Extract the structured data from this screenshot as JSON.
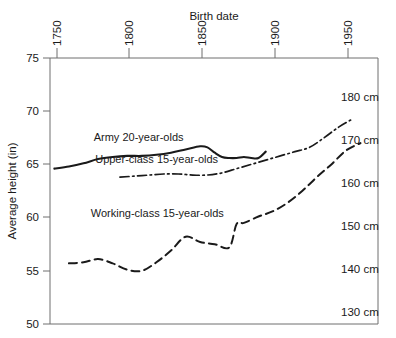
{
  "chart_data": {
    "type": "line",
    "title": "",
    "xlabel": "Birth date",
    "ylabel": "Average height (in)",
    "xlim": [
      1737,
      1962
    ],
    "ylim": [
      50,
      75
    ],
    "grid": false,
    "legend_position": "inline-annotations",
    "x_ticks": [
      "1750",
      "1800",
      "1850",
      "1900",
      "1950"
    ],
    "x_tick_values": [
      1750,
      1800,
      1850,
      1900,
      1950
    ],
    "y_ticks": [
      "75",
      "70",
      "65",
      "60",
      "55",
      "50"
    ],
    "y_tick_values": [
      75,
      70,
      65,
      60,
      55,
      50
    ],
    "secondary_axis": {
      "label": "cm",
      "ticks": [
        "180 cm",
        "170 cm",
        "160 cm",
        "150 cm",
        "140 cm",
        "130 cm"
      ],
      "values": [
        180,
        170,
        160,
        150,
        140,
        130
      ]
    },
    "series": [
      {
        "name": "Army  20-year-olds",
        "style": "solid",
        "label_x": 1767,
        "label_y": 67.2,
        "x": [
          1740,
          1750,
          1760,
          1770,
          1780,
          1790,
          1800,
          1810,
          1820,
          1830,
          1840,
          1845,
          1850,
          1855,
          1860,
          1865,
          1870,
          1875,
          1880,
          1885
        ],
        "y": [
          64.6,
          64.8,
          65.1,
          65.5,
          65.7,
          65.8,
          65.8,
          65.9,
          66.1,
          66.4,
          66.7,
          66.6,
          66.1,
          65.7,
          65.6,
          65.6,
          65.7,
          65.6,
          65.6,
          66.2
        ]
      },
      {
        "name": "Upper-class 15-year-olds",
        "style": "dash-dot",
        "label_x": 1768,
        "label_y": 65.1,
        "x": [
          1785,
          1795,
          1805,
          1815,
          1825,
          1835,
          1845,
          1855,
          1865,
          1875,
          1885,
          1895,
          1905,
          1915,
          1925,
          1935,
          1945
        ],
        "y": [
          63.8,
          63.9,
          64.0,
          64.1,
          64.1,
          64.0,
          64.0,
          64.2,
          64.6,
          65.0,
          65.4,
          65.8,
          66.2,
          66.6,
          67.5,
          68.5,
          69.3
        ]
      },
      {
        "name": "Working-class 15-year-olds",
        "style": "dashed",
        "label_x": 1765,
        "label_y": 60.1,
        "x": [
          1750,
          1760,
          1770,
          1780,
          1790,
          1800,
          1810,
          1820,
          1830,
          1840,
          1850,
          1860,
          1865,
          1870,
          1880,
          1890,
          1900,
          1910,
          1920,
          1930,
          1940,
          1950
        ],
        "y": [
          55.7,
          55.8,
          56.1,
          55.7,
          55.1,
          55.0,
          55.8,
          56.9,
          58.2,
          57.7,
          57.5,
          57.2,
          59.4,
          59.5,
          60.1,
          60.6,
          61.4,
          62.5,
          63.8,
          65.0,
          66.3,
          67.0
        ]
      }
    ]
  }
}
